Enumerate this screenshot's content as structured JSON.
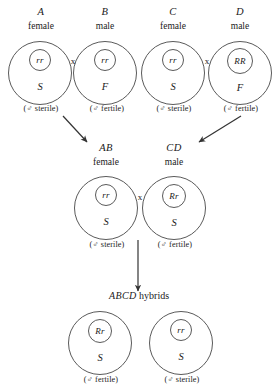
{
  "diagram": {
    "title_text": "ABCD hybrids",
    "stroke_color": "#5a5a5a",
    "text_color": "#1a1a1a",
    "background_color": "#ffffff",
    "cross_symbol": "x",
    "mars_symbol": "♂",
    "generations": [
      {
        "name": "parental-row",
        "cells": [
          {
            "id": "parent-a",
            "label": "A",
            "sex": "female",
            "nucleus": "rr",
            "cytoplasm": "S",
            "caption_prefix": "(",
            "caption_symbol": "♂",
            "caption_text": " sterile)"
          },
          {
            "id": "parent-b",
            "label": "B",
            "sex": "male",
            "nucleus": "rr",
            "cytoplasm": "F",
            "caption_prefix": "(",
            "caption_symbol": "♂",
            "caption_text": " fertile)"
          },
          {
            "id": "parent-c",
            "label": "C",
            "sex": "female",
            "nucleus": "rr",
            "cytoplasm": "S",
            "caption_prefix": "(",
            "caption_symbol": "♂",
            "caption_text": " sterile)"
          },
          {
            "id": "parent-d",
            "label": "D",
            "sex": "male",
            "nucleus": "RR",
            "cytoplasm": "F",
            "caption_prefix": "(",
            "caption_symbol": "♂",
            "caption_text": " fertile)"
          }
        ]
      },
      {
        "name": "f1-row",
        "cells": [
          {
            "id": "hybrid-ab",
            "label": "AB",
            "sex": "female",
            "nucleus": "rr",
            "cytoplasm": "S",
            "caption_prefix": "(",
            "caption_symbol": "♂",
            "caption_text": " sterile)"
          },
          {
            "id": "hybrid-cd",
            "label": "CD",
            "sex": "male",
            "nucleus": "Rr",
            "cytoplasm": "S",
            "caption_prefix": "(",
            "caption_symbol": "♂",
            "caption_text": " fertile)"
          }
        ]
      },
      {
        "name": "f2-row",
        "cells": [
          {
            "id": "offspring-fertile",
            "label": "",
            "sex": "",
            "nucleus": "Rr",
            "cytoplasm": "S",
            "caption_prefix": "(",
            "caption_symbol": "♂",
            "caption_text": " fertile)"
          },
          {
            "id": "offspring-sterile",
            "label": "",
            "sex": "",
            "nucleus": "rr",
            "cytoplasm": "S",
            "caption_prefix": "(",
            "caption_symbol": "♂",
            "caption_text": " sterile)"
          }
        ]
      }
    ],
    "hybrid_heading": {
      "italic_part": "ABCD",
      "plain_part": " hybrids"
    }
  }
}
